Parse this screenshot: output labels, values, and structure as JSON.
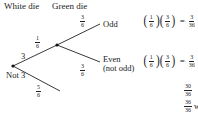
{
  "headers": {
    "first": "White die",
    "second": "Green die"
  },
  "first_stage": {
    "top": {
      "outcome": "3",
      "prob_num": "1",
      "prob_den": "6"
    },
    "bottom": {
      "outcome": "Not 3",
      "prob_num": "5",
      "prob_den": "6"
    }
  },
  "second_stage": {
    "top": {
      "outcome": "Odd",
      "prob_num": "3",
      "prob_den": "6"
    },
    "bottom": {
      "outcome_line1": "Even",
      "outcome_line2": "(not odd)",
      "prob_num": "3",
      "prob_den": "6"
    }
  },
  "results": [
    {
      "f1_num": "1",
      "f1_den": "6",
      "f2_num": "3",
      "f2_den": "6",
      "eq": "=",
      "res_num": "3",
      "res_den": "36"
    },
    {
      "f1_num": "1",
      "f1_den": "6",
      "f2_num": "3",
      "f2_den": "6",
      "eq": "=",
      "res_num": "3",
      "res_den": "36"
    }
  ],
  "extra_fractions": [
    {
      "num": "30",
      "den": "36"
    },
    {
      "num": "36",
      "den": "36",
      "suffix": "w"
    }
  ]
}
